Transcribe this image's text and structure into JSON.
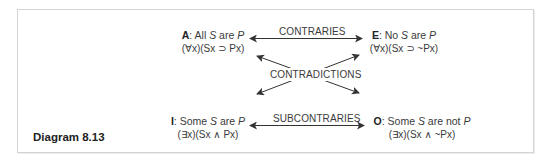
{
  "caption": "Diagram 8.13",
  "propositions": {
    "A": {
      "letter": "A",
      "sentence_pre": ": All ",
      "S": "S",
      "mid": " are ",
      "P": "P",
      "post": "",
      "formula": "(∀x)(Sx ⊃ Px)"
    },
    "E": {
      "letter": "E",
      "sentence_pre": ": No ",
      "S": "S",
      "mid": " are ",
      "P": "P",
      "post": "",
      "formula": "(∀x)(Sx ⊃ ~Px)"
    },
    "I": {
      "letter": "I",
      "sentence_pre": ": Some ",
      "S": "S",
      "mid": " are ",
      "P": "P",
      "post": "",
      "formula": "(∃x)(Sx ∧ Px)"
    },
    "O": {
      "letter": "O",
      "sentence_pre": ": Some ",
      "S": "S",
      "mid": " are not ",
      "P": "P",
      "post": "",
      "formula": "(∃x)(Sx ∧ ~Px)"
    }
  },
  "relations": {
    "contraries": "CONTRARIES",
    "contradictions": "CONTRADICTIONS",
    "subcontraries": "SUBCONTRARIES"
  },
  "colors": {
    "line": "#333333",
    "frame": "#d4d4d4",
    "text": "#3a3a3a"
  }
}
